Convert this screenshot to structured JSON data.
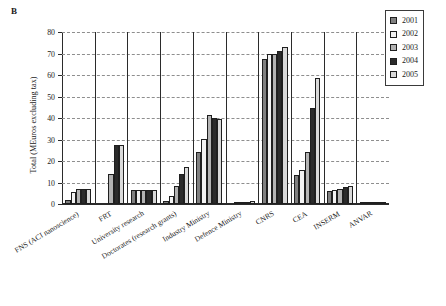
{
  "panel": {
    "label": "B"
  },
  "legend": {
    "position": "top-right",
    "entries": [
      {
        "label": "2001",
        "color": "#808080"
      },
      {
        "label": "2002",
        "color": "#f2f2f2"
      },
      {
        "label": "2003",
        "color": "#b3b3b3"
      },
      {
        "label": "2004",
        "color": "#2b2b2b"
      },
      {
        "label": "2005",
        "color": "#d9d9d9"
      }
    ]
  },
  "axes": {
    "ylabel": "Total (MEuros excluding tax)",
    "xlabel": "",
    "yticks": [
      0,
      10,
      20,
      30,
      40,
      50,
      60,
      70,
      80
    ],
    "ylim": [
      0,
      80
    ],
    "grid": true
  },
  "chart_data": {
    "type": "bar",
    "title": "",
    "subtitle": "",
    "xlabel": "",
    "ylabel": "Total (MEuros excluding tax)",
    "ylim": [
      0,
      80
    ],
    "grid": true,
    "legend_position": "top-right",
    "categories": [
      "FNS (ACI nanoscience)",
      "FRT",
      "University research",
      "Doctorates (research grants)",
      "Industry Ministry",
      "Defence Ministry",
      "CNRS",
      "CEA",
      "INSERM",
      "ANVAR"
    ],
    "series": [
      {
        "name": "2001",
        "color": "#808080",
        "values": [
          2.0,
          0.0,
          6.5,
          1.5,
          24.0,
          0.0,
          67.5,
          13.5,
          6.0,
          0.3
        ]
      },
      {
        "name": "2002",
        "color": "#f2f2f2",
        "values": [
          5.8,
          0.0,
          6.5,
          3.9,
          30.3,
          0.2,
          70.0,
          15.7,
          6.5,
          1.0
        ]
      },
      {
        "name": "2003",
        "color": "#b3b3b3",
        "values": [
          7.0,
          13.8,
          6.5,
          8.4,
          41.3,
          0.8,
          70.0,
          24.4,
          7.0,
          0.4
        ]
      },
      {
        "name": "2004",
        "color": "#2b2b2b",
        "values": [
          7.0,
          27.6,
          6.5,
          13.8,
          39.8,
          1.0,
          71.3,
          44.5,
          7.9,
          0.3
        ]
      },
      {
        "name": "2005",
        "color": "#d9d9d9",
        "values": [
          7.0,
          27.5,
          6.5,
          17.0,
          39.5,
          1.2,
          72.8,
          58.5,
          8.5,
          0.3
        ]
      }
    ]
  }
}
